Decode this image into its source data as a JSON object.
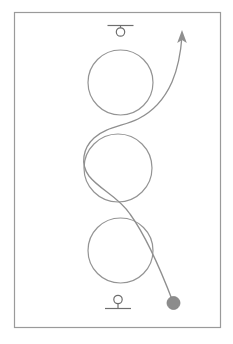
{
  "figure": {
    "title": "",
    "canvas": {
      "width": 233,
      "height": 344
    },
    "background_color": "#ffffff",
    "frame": {
      "name": "figure-border",
      "x": 14.5,
      "y": 12.5,
      "width": 206,
      "height": 315,
      "stroke": "#9a9a9a",
      "stroke_width": 1.2,
      "fill": "none"
    },
    "stroke_color": "#8f8f8f",
    "circle_stroke_color": "#949494",
    "support_stroke_color": "#6e6e6e",
    "ball_fill_color": "#8c8c8c",
    "circles": [
      {
        "name": "circle-top",
        "cx": 120.5,
        "cy": 82.5,
        "r": 32.5
      },
      {
        "name": "circle-middle",
        "cx": 118.0,
        "cy": 168.0,
        "r": 34.0
      },
      {
        "name": "circle-bottom",
        "cx": 120.5,
        "cy": 250.5,
        "r": 32.5
      }
    ],
    "trajectory": {
      "name": "trajectory-curve",
      "stroke": "#8f8f8f",
      "stroke_width": 1.3,
      "path": "M 173 302 C 160 268 146 236 130 214 C 118 196 100 190 89 176 C 80 164 83 148 94 138 C 106 127 124 126 138 119 C 152 112 164 100 172 82 C 178 68 181 50 182 36"
    },
    "arrow": {
      "name": "direction-arrow-head",
      "tip_x": 182,
      "tip_y": 30,
      "points": "182,30 177.2,43 182,40 186.8,43",
      "fill": "#8f8f8f"
    },
    "ball": {
      "name": "mass-ball",
      "cx": 173.5,
      "cy": 303.0,
      "r": 6.5,
      "fill": "#8c8c8c",
      "stroke": "#7f7f7f"
    },
    "supports": {
      "top": {
        "name": "pin-support-top",
        "bar": {
          "x1": 107.5,
          "y1": 25.5,
          "x2": 133.5,
          "y2": 25.5
        },
        "stem": {
          "x1": 120.5,
          "y1": 25.5,
          "x2": 120.5,
          "y2": 28.0
        },
        "circle": {
          "cx": 120.5,
          "cy": 32.0,
          "r": 4.2
        },
        "stroke": "#6e6e6e",
        "stroke_width": 1.2
      },
      "bottom": {
        "name": "pin-support-bottom",
        "circle": {
          "cx": 118.0,
          "cy": 299.5,
          "r": 4.2
        },
        "stem": {
          "x1": 118.0,
          "y1": 303.7,
          "x2": 118.0,
          "y2": 308.5
        },
        "bar": {
          "x1": 105.0,
          "y1": 308.5,
          "x2": 131.0,
          "y2": 308.5
        },
        "stroke": "#6e6e6e",
        "stroke_width": 1.2
      }
    }
  }
}
